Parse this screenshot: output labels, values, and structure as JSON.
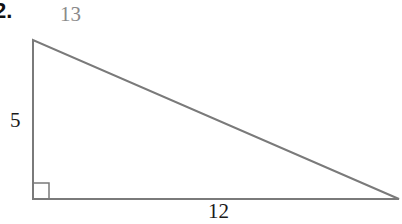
{
  "problem_number": "2.",
  "triangle": {
    "hypotenuse_label": "13",
    "vertical_leg_label": "5",
    "horizontal_leg_label": "12",
    "right_angle_marker": true
  },
  "colors": {
    "stroke": "#7a7a7a",
    "hypotenuse_label": "#8a8a8a",
    "text": "#1a1a1a"
  }
}
